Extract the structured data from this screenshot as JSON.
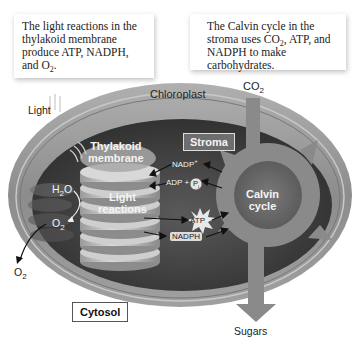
{
  "captions": {
    "left": {
      "text": "The light reactions in the thylakoid membrane produce ATP, NADPH, and O",
      "sub": "2",
      "tail": "."
    },
    "right": {
      "pre": "The Calvin cycle in the stroma uses CO",
      "sub": "2",
      "post": ", ATP, and NADPH to make carbohydrates."
    }
  },
  "labels": {
    "chloroplast": "Chloroplast",
    "light": "Light",
    "co2": "CO",
    "co2_sub": "2",
    "stroma": "Stroma",
    "thylakoid_1": "Thylakoid",
    "thylakoid_2": "membrane",
    "light_reactions_1": "Light",
    "light_reactions_2": "reactions",
    "h2o": "H",
    "h2o_sub": "2",
    "h2o_tail": "O",
    "o2_inner": "O",
    "o2_inner_sub": "2",
    "o2_outer": "O",
    "o2_outer_sub": "2",
    "nadp_plus": "NADP",
    "nadp_plus_sup": "+",
    "adp_plus": "ADP +",
    "pi": "P",
    "pi_sub": "i",
    "atp": "ATP",
    "nadph": "NADPH",
    "calvin_1": "Calvin",
    "calvin_2": "cycle",
    "cytosol": "Cytosol",
    "sugars": "Sugars"
  },
  "colors": {
    "outer_membrane": "#9a9a9a",
    "interior": "#4a4a4a",
    "thylakoid": "#bdbdbd",
    "cycle_arrow": "#8a8a8a",
    "text_dark": "#222222"
  }
}
